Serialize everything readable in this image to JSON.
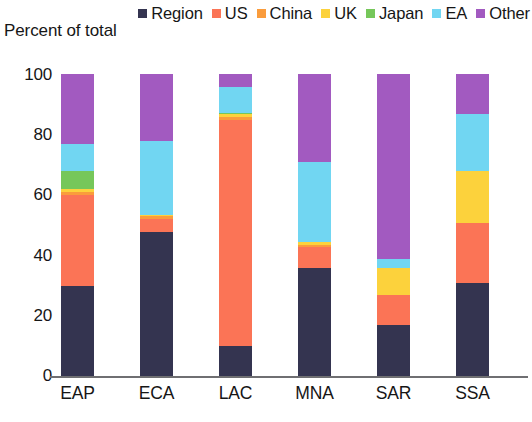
{
  "chart_data": {
    "type": "bar",
    "stacked": true,
    "title": "",
    "subtitle": "",
    "xlabel": "",
    "ylabel": "Percent of total",
    "ylim": [
      0,
      100
    ],
    "yticks": [
      0,
      20,
      40,
      60,
      80,
      100
    ],
    "ytick_labels": [
      "0",
      "20",
      "40",
      "60",
      "80",
      "100"
    ],
    "grid": false,
    "legend_position": "top-right",
    "categories": [
      "EAP",
      "ECA",
      "LAC",
      "MNA",
      "SAR",
      "SSA"
    ],
    "series": [
      {
        "name": "Region",
        "color": "#343450",
        "values": [
          30,
          48,
          10,
          36,
          17,
          31
        ]
      },
      {
        "name": "US",
        "color": "#fb7456",
        "values": [
          30,
          4,
          75,
          7,
          10,
          20
        ]
      },
      {
        "name": "China",
        "color": "#fa9c3c",
        "values": [
          1,
          1,
          1,
          0.5,
          0,
          0
        ]
      },
      {
        "name": "UK",
        "color": "#fcd23c",
        "values": [
          1,
          0.5,
          1,
          1,
          9,
          17
        ]
      },
      {
        "name": "Japan",
        "color": "#76c75a",
        "values": [
          6,
          0,
          0.5,
          0,
          0,
          0
        ]
      },
      {
        "name": "EA",
        "color": "#71d6f2",
        "values": [
          9,
          24.5,
          8.5,
          26.5,
          3,
          19
        ]
      },
      {
        "name": "Other",
        "color": "#a25ac0",
        "values": [
          23,
          22,
          4,
          29,
          61,
          13
        ]
      }
    ]
  },
  "legend": {
    "items": [
      {
        "label": "Region",
        "color": "#343450"
      },
      {
        "label": "US",
        "color": "#fb7456"
      },
      {
        "label": "China",
        "color": "#fa9c3c"
      },
      {
        "label": "UK",
        "color": "#fcd23c"
      },
      {
        "label": "Japan",
        "color": "#76c75a"
      },
      {
        "label": "EA",
        "color": "#71d6f2"
      },
      {
        "label": "Other",
        "color": "#a25ac0"
      }
    ]
  },
  "axis": {
    "y_title": "Percent of total",
    "y_tick_labels": [
      "100",
      "80",
      "60",
      "40",
      "20",
      "0"
    ],
    "x_tick_labels": [
      "EAP",
      "ECA",
      "LAC",
      "MNA",
      "SAR",
      "SSA"
    ]
  }
}
